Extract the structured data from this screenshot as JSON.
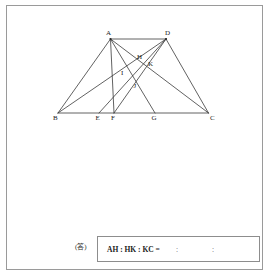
{
  "figure": {
    "type": "geometry-diagram",
    "shape": "trapezoid",
    "stroke_color": "#3a3a3a",
    "points": {
      "A": {
        "label": "A",
        "x": 110.5,
        "y": 39.0,
        "label_x": 106.0,
        "label_y": 30.0
      },
      "D": {
        "label": "D",
        "x": 166.0,
        "y": 39.0,
        "label_x": 165.0,
        "label_y": 30.0
      },
      "B": {
        "label": "B",
        "x": 58.0,
        "y": 113.0,
        "label_x": 53.0,
        "label_y": 115.0
      },
      "C": {
        "label": "C",
        "x": 208.5,
        "y": 113.0,
        "label_x": 210.0,
        "label_y": 115.0
      },
      "E": {
        "label": "E",
        "x": 99.0,
        "y": 113.0,
        "label_x": 95.5,
        "label_y": 115.0
      },
      "F": {
        "label": "F",
        "x": 114.0,
        "y": 113.0,
        "label_x": 111.0,
        "label_y": 115.0
      },
      "G": {
        "label": "G",
        "x": 155.0,
        "y": 113.0,
        "label_x": 151.5,
        "label_y": 115.0
      },
      "H": {
        "label": "H",
        "x": 140.0,
        "y": 62.0,
        "label_x": 137.0,
        "label_y": 53.5
      },
      "I": {
        "label": "I",
        "x": 126.0,
        "y": 76.5,
        "label_x": 121.0,
        "label_y": 69.5
      },
      "J": {
        "label": "J",
        "x": 136.5,
        "y": 90.0,
        "label_x": 133.5,
        "label_y": 82.5
      },
      "K": {
        "label": "K",
        "x": 146.5,
        "y": 69.0,
        "label_x": 148.0,
        "label_y": 61.0
      }
    },
    "segments": [
      {
        "name": "side-AD",
        "from": "A",
        "to": "D"
      },
      {
        "name": "side-AB",
        "from": "A",
        "to": "B"
      },
      {
        "name": "side-DC",
        "from": "D",
        "to": "C"
      },
      {
        "name": "base-BC",
        "from": "B",
        "to": "C"
      },
      {
        "name": "cevian-AC",
        "from": "A",
        "to": "C"
      },
      {
        "name": "cevian-AG",
        "from": "A",
        "to": "G"
      },
      {
        "name": "cevian-AF",
        "from": "A",
        "to": "F"
      },
      {
        "name": "cevian-DB",
        "from": "D",
        "to": "B"
      },
      {
        "name": "cevian-DE",
        "from": "D",
        "to": "E"
      },
      {
        "name": "cevian-DF",
        "from": "D",
        "to": "F"
      }
    ],
    "vertex_order": [
      "A",
      "D",
      "B",
      "C",
      "E",
      "F",
      "G",
      "H",
      "I",
      "J",
      "K"
    ]
  },
  "answer": {
    "tag": "(答)",
    "expression": "AH : HK : KC =",
    "separator": ":",
    "blank_1": "",
    "blank_2": "",
    "blank_3": ""
  }
}
